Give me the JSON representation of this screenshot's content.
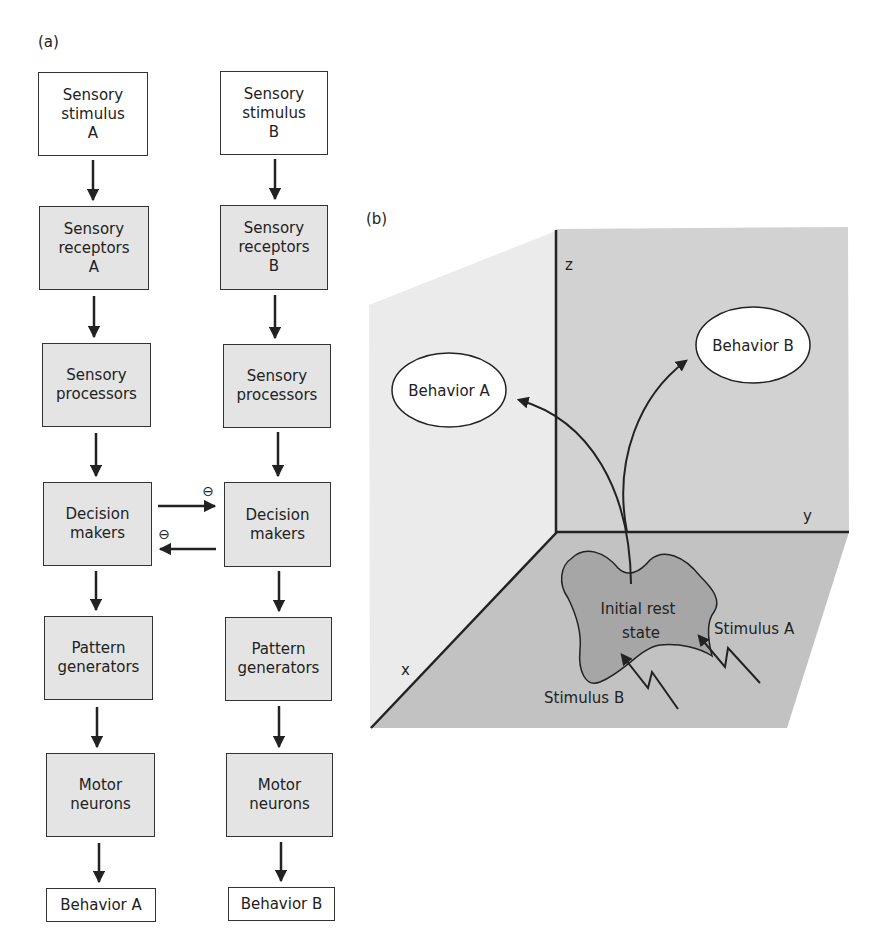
{
  "panel_a": {
    "label": "(a)",
    "column_a": [
      {
        "text": "Sensory\nstimulus\nA",
        "style": "white"
      },
      {
        "text": "Sensory\nreceptors\nA",
        "style": "grey"
      },
      {
        "text": "Sensory\nprocessors",
        "style": "grey"
      },
      {
        "text": "Decision\nmakers",
        "style": "grey"
      },
      {
        "text": "Pattern\ngenerators",
        "style": "grey"
      },
      {
        "text": "Motor\nneurons",
        "style": "grey"
      },
      {
        "text": "Behavior A",
        "style": "white"
      }
    ],
    "column_b": [
      {
        "text": "Sensory\nstimulus\nB",
        "style": "white"
      },
      {
        "text": "Sensory\nreceptors\nB",
        "style": "grey"
      },
      {
        "text": "Sensory\nprocessors",
        "style": "grey"
      },
      {
        "text": "Decision\nmakers",
        "style": "grey"
      },
      {
        "text": "Pattern\ngenerators",
        "style": "grey"
      },
      {
        "text": "Motor\nneurons",
        "style": "grey"
      },
      {
        "text": "Behavior B",
        "style": "white"
      }
    ],
    "inhibition_symbol": "⊖"
  },
  "panel_b": {
    "label": "(b)",
    "axes": {
      "x": "x",
      "y": "y",
      "z": "z"
    },
    "behavior_a": "Behavior A",
    "behavior_b": "Behavior B",
    "rest_state_line1": "Initial  rest",
    "rest_state_line2": "state",
    "stimulus_a": "Stimulus A",
    "stimulus_b": "Stimulus B"
  },
  "colors": {
    "white_box": "#ffffff",
    "grey_box": "#e4e4e4",
    "left_wall": "#ebebeb",
    "back_wall": "#d2d2d2",
    "floor": "#c2c2c2",
    "blob": "#a6a6a6",
    "line": "#222222"
  }
}
